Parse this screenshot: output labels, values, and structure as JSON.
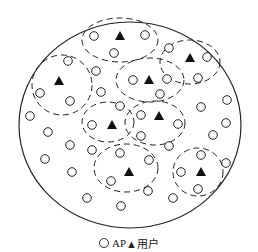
{
  "legend": {
    "ap_label": "AP",
    "user_label": "▲用户",
    "ap_symbol": "circle-outline",
    "user_symbol": "filled-triangle"
  },
  "diagram": {
    "boundary": {
      "cx": 130,
      "cy": 125,
      "rx": 111,
      "ry": 103
    },
    "clusters": [
      {
        "cx": 120,
        "cy": 40,
        "rx": 38,
        "ry": 22
      },
      {
        "cx": 190,
        "cy": 62,
        "rx": 30,
        "ry": 22
      },
      {
        "cx": 62,
        "cy": 85,
        "rx": 30,
        "ry": 30
      },
      {
        "cx": 150,
        "cy": 80,
        "rx": 34,
        "ry": 22
      },
      {
        "cx": 108,
        "cy": 122,
        "rx": 26,
        "ry": 20
      },
      {
        "cx": 155,
        "cy": 123,
        "rx": 30,
        "ry": 22
      },
      {
        "cx": 126,
        "cy": 168,
        "rx": 32,
        "ry": 24
      },
      {
        "cx": 198,
        "cy": 172,
        "rx": 25,
        "ry": 24
      }
    ],
    "users": [
      [
        120,
        36
      ],
      [
        190,
        58
      ],
      [
        59,
        81
      ],
      [
        149,
        80
      ],
      [
        112,
        125
      ],
      [
        159,
        116
      ],
      [
        129,
        172
      ],
      [
        201,
        172
      ]
    ],
    "aps": [
      [
        94,
        36
      ],
      [
        145,
        35
      ],
      [
        114,
        53
      ],
      [
        169,
        48
      ],
      [
        207,
        57
      ],
      [
        198,
        78
      ],
      [
        68,
        61
      ],
      [
        96,
        71
      ],
      [
        40,
        93
      ],
      [
        70,
        101
      ],
      [
        101,
        92
      ],
      [
        133,
        80
      ],
      [
        167,
        79
      ],
      [
        160,
        94
      ],
      [
        227,
        100
      ],
      [
        201,
        107
      ],
      [
        30,
        116
      ],
      [
        120,
        106
      ],
      [
        141,
        115
      ],
      [
        226,
        123
      ],
      [
        92,
        125
      ],
      [
        178,
        124
      ],
      [
        48,
        132
      ],
      [
        213,
        135
      ],
      [
        141,
        136
      ],
      [
        70,
        145
      ],
      [
        92,
        150
      ],
      [
        169,
        146
      ],
      [
        120,
        153
      ],
      [
        149,
        160
      ],
      [
        45,
        159
      ],
      [
        226,
        163
      ],
      [
        72,
        172
      ],
      [
        181,
        172
      ],
      [
        111,
        181
      ],
      [
        201,
        155
      ],
      [
        198,
        189
      ],
      [
        148,
        191
      ],
      [
        87,
        198
      ],
      [
        173,
        198
      ],
      [
        121,
        206
      ]
    ]
  }
}
